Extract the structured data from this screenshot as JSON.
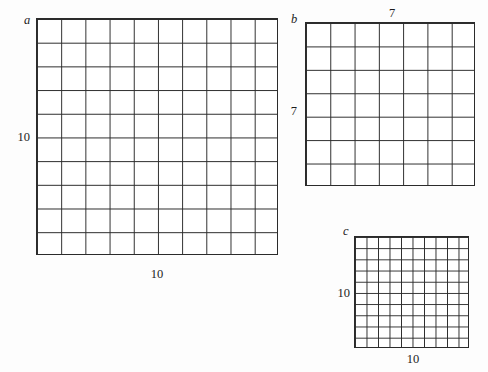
{
  "figure": {
    "background_color": "#fdfdfd",
    "line_color": "#2b2b2b",
    "panels": [
      {
        "key": "a",
        "letter": "a",
        "columns": 10,
        "rows": 10,
        "left_label": "10",
        "bottom_label": "10",
        "top_label": ""
      },
      {
        "key": "b",
        "letter": "b",
        "columns": 7,
        "rows": 7,
        "left_label": "7",
        "bottom_label": "",
        "top_label": "7"
      },
      {
        "key": "c",
        "letter": "c",
        "columns": 10,
        "rows": 10,
        "left_label": "10",
        "bottom_label": "10",
        "top_label": ""
      }
    ]
  },
  "chart_data": {
    "type": "table",
    "title": "",
    "xlabel": "",
    "ylabel": "",
    "categories": [
      "a",
      "b",
      "c"
    ],
    "series": [
      {
        "name": "columns",
        "values": [
          10,
          7,
          10
        ]
      },
      {
        "name": "rows",
        "values": [
          10,
          7,
          10
        ]
      }
    ],
    "annotations": [
      {
        "panel": "a",
        "position": "left",
        "text": "10"
      },
      {
        "panel": "a",
        "position": "bottom",
        "text": "10"
      },
      {
        "panel": "b",
        "position": "top",
        "text": "7"
      },
      {
        "panel": "b",
        "position": "left",
        "text": "7"
      },
      {
        "panel": "c",
        "position": "left",
        "text": "10"
      },
      {
        "panel": "c",
        "position": "bottom",
        "text": "10"
      }
    ],
    "grid": true,
    "legend": "none"
  }
}
